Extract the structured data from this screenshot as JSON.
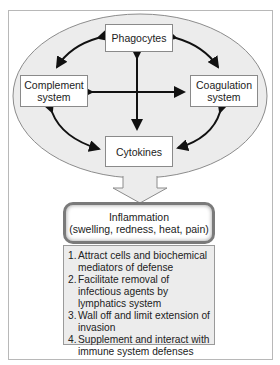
{
  "diagram": {
    "nodes": {
      "phagocytes": "Phagocytes",
      "complement_line1": "Complement",
      "complement_line2": "system",
      "coagulation_line1": "Coagulation",
      "coagulation_line2": "system",
      "cytokines": "Cytokines"
    },
    "result": {
      "title": "Inflammation",
      "subtitle": "(swelling, redness, heat, pain)"
    },
    "functions": [
      {
        "num": "1.",
        "text": "Attract cells and biochemical mediators of defense"
      },
      {
        "num": "2.",
        "text": "Facilitate removal of infectious agents by lymphatics system"
      },
      {
        "num": "3.",
        "text": "Wall off and limit extension of invasion"
      },
      {
        "num": "4.",
        "text": "Supplement and interact with immune system defenses"
      }
    ],
    "colors": {
      "ellipse_fill": "#ececec",
      "ellipse_stroke": "#8c8c8c",
      "arrow": "#111111",
      "list_fill": "#ececec"
    }
  }
}
